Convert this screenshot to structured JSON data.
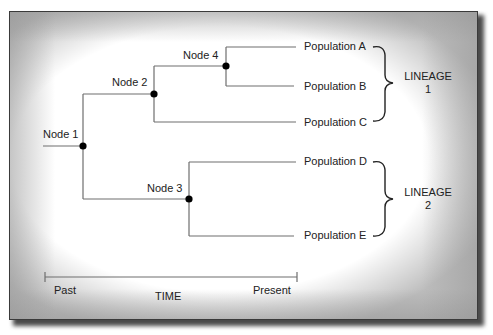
{
  "diagram": {
    "type": "phylogenetic-tree",
    "nodes": [
      {
        "id": "node-1",
        "label": "Node 1"
      },
      {
        "id": "node-2",
        "label": "Node 2"
      },
      {
        "id": "node-3",
        "label": "Node 3"
      },
      {
        "id": "node-4",
        "label": "Node 4"
      }
    ],
    "populations": [
      {
        "id": "pop-a",
        "label": "Population A"
      },
      {
        "id": "pop-b",
        "label": "Population B"
      },
      {
        "id": "pop-c",
        "label": "Population C"
      },
      {
        "id": "pop-d",
        "label": "Population D"
      },
      {
        "id": "pop-e",
        "label": "Population E"
      }
    ],
    "lineages": [
      {
        "title": "LINEAGE",
        "number": "1",
        "members": [
          "Population A",
          "Population B",
          "Population C"
        ]
      },
      {
        "title": "LINEAGE",
        "number": "2",
        "members": [
          "Population D",
          "Population E"
        ]
      }
    ],
    "time_axis": {
      "start_label": "Past",
      "end_label": "Present",
      "title": "TIME"
    },
    "edges": [
      [
        "Node 1",
        "Node 2"
      ],
      [
        "Node 1",
        "Node 3"
      ],
      [
        "Node 2",
        "Node 4"
      ],
      [
        "Node 2",
        "Population C"
      ],
      [
        "Node 4",
        "Population A"
      ],
      [
        "Node 4",
        "Population B"
      ],
      [
        "Node 3",
        "Population D"
      ],
      [
        "Node 3",
        "Population E"
      ]
    ],
    "colors": {
      "line": "#6e6e6e",
      "node": "#000000",
      "text": "#222222"
    }
  }
}
